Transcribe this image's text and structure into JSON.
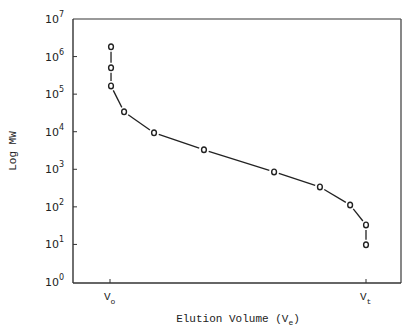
{
  "chart_data": {
    "type": "line",
    "title": "",
    "xlabel": "Elution Volume (Ve)",
    "xlabel_main": "Elution Volume (V",
    "xlabel_sub": "e",
    "xlabel_close": ")",
    "ylabel": "Log MW",
    "yscale": "log",
    "ylim": [
      1,
      10000000
    ],
    "y_ticks": [
      {
        "base": "10",
        "exp": "0",
        "value": 1
      },
      {
        "base": "10",
        "exp": "1",
        "value": 10
      },
      {
        "base": "10",
        "exp": "2",
        "value": 100
      },
      {
        "base": "10",
        "exp": "3",
        "value": 1000
      },
      {
        "base": "10",
        "exp": "4",
        "value": 10000
      },
      {
        "base": "10",
        "exp": "5",
        "value": 100000
      },
      {
        "base": "10",
        "exp": "6",
        "value": 1000000
      },
      {
        "base": "10",
        "exp": "7",
        "value": 10000000
      }
    ],
    "x_ticks": [
      {
        "label": "V",
        "sub": "o",
        "position": 0.0
      },
      {
        "label": "V",
        "sub": "t",
        "position": 1.0
      }
    ],
    "x_note": "x normalized: 0 = Vo (void volume), 1 = Vt (total volume)",
    "grid": false,
    "legend": null,
    "marker": "open-circle",
    "series": [
      {
        "name": "calibration curve",
        "x": [
          0.004,
          0.004,
          0.004,
          0.055,
          0.172,
          0.367,
          0.641,
          0.82,
          0.938,
          1.0,
          1.0
        ],
        "log_y": [
          6.26,
          5.7,
          5.22,
          4.53,
          3.97,
          3.52,
          2.93,
          2.53,
          2.05,
          1.52,
          0.99
        ],
        "y": [
          1820000,
          500000,
          166000,
          33900,
          9330,
          3310,
          851,
          339,
          112,
          33,
          10
        ]
      }
    ]
  }
}
